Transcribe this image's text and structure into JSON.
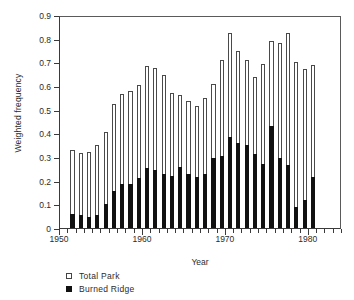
{
  "chart_data": {
    "type": "bar",
    "title": "",
    "xlabel": "Year",
    "ylabel": "Weighted frequency",
    "ylim": [
      0,
      0.9
    ],
    "ytick_values": [
      0,
      0.1,
      0.2,
      0.3,
      0.4,
      0.5,
      0.6,
      0.7,
      0.8,
      0.9
    ],
    "ytick_labels": [
      "0",
      "0.1",
      "0.2",
      "0.3",
      "0.4",
      "0.5",
      "0.6",
      "0.7",
      "0.8",
      "0.9"
    ],
    "xlim": [
      1950,
      1984
    ],
    "xtick_major_values": [
      1950,
      1960,
      1970,
      1980
    ],
    "xtick_major_labels": [
      "1950",
      "1960",
      "1970",
      "1980"
    ],
    "xtick_minor_step": 1,
    "grid": false,
    "legend_position": "below-left",
    "overlap": "overlaid",
    "categories": [
      1951,
      1952,
      1953,
      1954,
      1955,
      1956,
      1957,
      1958,
      1959,
      1960,
      1961,
      1962,
      1963,
      1964,
      1965,
      1966,
      1967,
      1968,
      1969,
      1970,
      1971,
      1972,
      1973,
      1974,
      1975,
      1976,
      1977,
      1978,
      1979,
      1980,
      1981,
      1982,
      1983
    ],
    "series": [
      {
        "name": "Total Park",
        "color": "#ffffff",
        "edge_color": "#4a4a4a",
        "values": [
          0.33,
          0.315,
          0.32,
          0.35,
          0.405,
          0.525,
          0.565,
          0.58,
          0.605,
          0.685,
          0.675,
          0.645,
          0.57,
          0.56,
          0.535,
          0.515,
          0.55,
          0.61,
          0.71,
          0.825,
          0.75,
          0.71,
          0.64,
          0.695,
          0.79,
          0.78,
          0.825,
          0.7,
          0.67,
          0.69,
          0.0,
          0.0,
          0.0
        ]
      },
      {
        "name": "Burned Ridge",
        "color": "#111111",
        "edge_color": "#111111",
        "values": [
          0.06,
          0.057,
          0.045,
          0.055,
          0.1,
          0.155,
          0.185,
          0.185,
          0.21,
          0.255,
          0.247,
          0.23,
          0.22,
          0.256,
          0.228,
          0.215,
          0.228,
          0.296,
          0.306,
          0.385,
          0.358,
          0.35,
          0.313,
          0.27,
          0.43,
          0.295,
          0.265,
          0.088,
          0.12,
          0.215,
          0.0,
          0.0,
          0.0
        ]
      }
    ],
    "bars": [
      {
        "year": 1951,
        "total_park": 0.33,
        "burned_ridge": 0.06
      },
      {
        "year": 1952,
        "total_park": 0.315,
        "burned_ridge": 0.057
      },
      {
        "year": 1953,
        "total_park": 0.32,
        "burned_ridge": 0.045
      },
      {
        "year": 1954,
        "total_park": 0.35,
        "burned_ridge": 0.055
      },
      {
        "year": 1955,
        "total_park": 0.405,
        "burned_ridge": 0.1
      },
      {
        "year": 1956,
        "total_park": 0.525,
        "burned_ridge": 0.155
      },
      {
        "year": 1957,
        "total_park": 0.565,
        "burned_ridge": 0.185
      },
      {
        "year": 1958,
        "total_park": 0.58,
        "burned_ridge": 0.185
      },
      {
        "year": 1959,
        "total_park": 0.605,
        "burned_ridge": 0.21
      },
      {
        "year": 1960,
        "total_park": 0.685,
        "burned_ridge": 0.255
      },
      {
        "year": 1961,
        "total_park": 0.675,
        "burned_ridge": 0.247
      },
      {
        "year": 1962,
        "total_park": 0.645,
        "burned_ridge": 0.23
      },
      {
        "year": 1963,
        "total_park": 0.57,
        "burned_ridge": 0.22
      },
      {
        "year": 1964,
        "total_park": 0.56,
        "burned_ridge": 0.256
      },
      {
        "year": 1965,
        "total_park": 0.535,
        "burned_ridge": 0.228
      },
      {
        "year": 1966,
        "total_park": 0.515,
        "burned_ridge": 0.215
      },
      {
        "year": 1967,
        "total_park": 0.55,
        "burned_ridge": 0.228
      },
      {
        "year": 1968,
        "total_park": 0.61,
        "burned_ridge": 0.296
      },
      {
        "year": 1969,
        "total_park": 0.71,
        "burned_ridge": 0.306
      },
      {
        "year": 1970,
        "total_park": 0.825,
        "burned_ridge": 0.385
      },
      {
        "year": 1971,
        "total_park": 0.75,
        "burned_ridge": 0.358
      },
      {
        "year": 1972,
        "total_park": 0.71,
        "burned_ridge": 0.35
      },
      {
        "year": 1973,
        "total_park": 0.64,
        "burned_ridge": 0.313
      },
      {
        "year": 1974,
        "total_park": 0.695,
        "burned_ridge": 0.27
      },
      {
        "year": 1975,
        "total_park": 0.79,
        "burned_ridge": 0.43
      },
      {
        "year": 1976,
        "total_park": 0.78,
        "burned_ridge": 0.295
      },
      {
        "year": 1977,
        "total_park": 0.825,
        "burned_ridge": 0.265
      },
      {
        "year": 1978,
        "total_park": 0.7,
        "burned_ridge": 0.088
      },
      {
        "year": 1979,
        "total_park": 0.67,
        "burned_ridge": 0.12
      },
      {
        "year": 1980,
        "total_park": 0.69,
        "burned_ridge": 0.215
      }
    ]
  },
  "legend": {
    "items": [
      {
        "label": "Total Park",
        "marker": "open-square-icon"
      },
      {
        "label": "Burned Ridge",
        "marker": "filled-square-icon"
      }
    ]
  }
}
